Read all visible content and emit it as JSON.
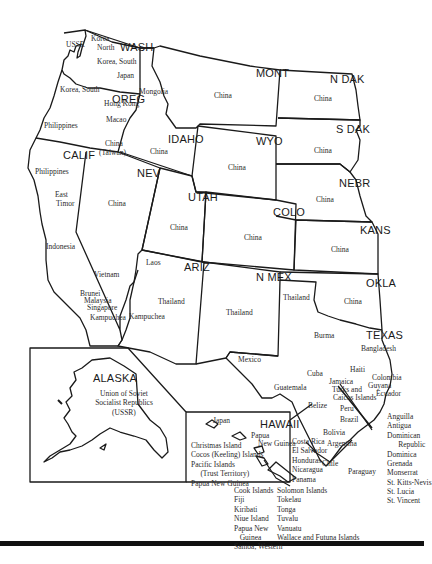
{
  "map": {
    "title": "Western United States with overlaid comparison countries",
    "states": [
      {
        "id": "wash",
        "label": "WASH",
        "countries": [
          "Korea, North",
          "Korea, South",
          "Japan"
        ]
      },
      {
        "id": "oreg",
        "label": "OREG",
        "countries": [
          "Korea, South",
          "Hong Kong",
          "Macao",
          "China (Taiwan)",
          "Philippines"
        ]
      },
      {
        "id": "calif",
        "label": "CALIF",
        "countries": [
          "Philippines",
          "East Timor",
          "Indonesia",
          "Vietnam",
          "Brunei",
          "Malaysia",
          "Singapore",
          "Kampuchea"
        ]
      },
      {
        "id": "idaho",
        "label": "IDAHO",
        "countries": [
          "Mongolia",
          "China"
        ]
      },
      {
        "id": "nev",
        "label": "NEV",
        "countries": [
          "China"
        ]
      },
      {
        "id": "mont",
        "label": "MONT",
        "countries": [
          "China"
        ]
      },
      {
        "id": "wyo",
        "label": "WYO",
        "countries": [
          "China"
        ]
      },
      {
        "id": "utah",
        "label": "UTAH",
        "countries": [
          "China"
        ]
      },
      {
        "id": "colo",
        "label": "COLO",
        "countries": [
          "China"
        ]
      },
      {
        "id": "ariz",
        "label": "ARIZ",
        "countries": [
          "Laos",
          "Thailand",
          "Kampuchea"
        ]
      },
      {
        "id": "nmex",
        "label": "N MEX",
        "countries": [
          "Thailand"
        ]
      },
      {
        "id": "ndak",
        "label": "N DAK",
        "countries": [
          "China"
        ]
      },
      {
        "id": "sdak",
        "label": "S DAK",
        "countries": [
          "China"
        ]
      },
      {
        "id": "nebr",
        "label": "NEBR",
        "countries": [
          "China"
        ]
      },
      {
        "id": "kans",
        "label": "KANS",
        "countries": [
          "China"
        ]
      },
      {
        "id": "okla",
        "label": "OKLA",
        "countries": [
          "China"
        ]
      },
      {
        "id": "texas",
        "label": "TEXAS",
        "countries": [
          "Thailand",
          "Burma",
          "Bangladesh",
          "Mexico",
          "Cuba",
          "Guatemala",
          "Belize",
          "Haiti",
          "Jamaica",
          "Turks and Caicos Islands",
          "Colombia",
          "Guyana",
          "Ecuador",
          "Peru",
          "Brazil",
          "Bolivia",
          "Argentina",
          "Costa Rica",
          "El Salvador",
          "Honduras",
          "Nicaragua",
          "Panama",
          "Chile",
          "Paraguay"
        ]
      },
      {
        "id": "alaska",
        "label": "ALASKA",
        "countries": [
          "Union of Soviet Socialist Republics (USSR)"
        ]
      },
      {
        "id": "hawaii",
        "label": "HAWAII",
        "countries": [
          "Japan",
          "Papua New Guinea",
          "Christmas Island",
          "Cocos (Keeling) Islands",
          "Pacific Islands (Trust Territory)",
          "Papua New Guinea"
        ]
      }
    ],
    "labels": {
      "wash": "WASH",
      "oreg": "OREG",
      "calif": "CALIF",
      "idaho": "IDAHO",
      "nev": "NEV",
      "mont": "MONT",
      "wyo": "WYO",
      "utah": "UTAH",
      "colo": "COLO",
      "ariz": "ARIZ",
      "nmex": "N MEX",
      "ndak": "N DAK",
      "sdak": "S DAK",
      "nebr": "NEBR",
      "kans": "KANS",
      "okla": "OKLA",
      "texas": "TEXAS",
      "alaska": "ALASKA",
      "hawaii": "HAWAII"
    },
    "countries": {
      "ussr_nw": "USSR",
      "korea_north_1": "Korea",
      "korea_north_2": "North",
      "korea_south_wa": "Korea, South",
      "japan_wa": "Japan",
      "korea_south_or": "Korea, South",
      "hong_kong": "Hong Kong",
      "macao": "Macao",
      "philippines_or": "Philippines",
      "china_taiwan_1": "China",
      "china_taiwan_2": "(Taiwan)",
      "mongolia": "Mongolia",
      "china_idaho": "China",
      "china_mont": "China",
      "china_ndak": "China",
      "china_sdak": "China",
      "china_wyo": "China",
      "china_nebr": "China",
      "china_nev": "China",
      "china_utah": "China",
      "china_colo": "China",
      "china_kans": "China",
      "china_okla": "China",
      "philippines_ca": "Philippines",
      "east_timor_1": "East",
      "east_timor_2": "Timor",
      "indonesia": "Indonesia",
      "vietnam": "Vietnam",
      "laos": "Laos",
      "brunei": "Brunei",
      "malaysia": "Malaysia",
      "singapore": "Singapore",
      "kampuchea_ca": "Kampuchea",
      "kampuchea_az": "Kampuchea",
      "thailand_az": "Thailand",
      "thailand_nm": "Thailand",
      "thailand_tx": "Thailand",
      "burma": "Burma",
      "bangladesh": "Bangladesh",
      "mexico": "Mexico",
      "cuba": "Cuba",
      "guatemala": "Guatemala",
      "belize": "Belize",
      "haiti": "Haiti",
      "jamaica": "Jamaica",
      "turks_1": "Turks and",
      "turks_2": "Caicos Islands",
      "colombia": "Colombia",
      "guyana": "Guyana",
      "ecuador": "Ecuador",
      "peru": "Peru",
      "brazil": "Brazil",
      "bolivia": "Bolivia",
      "argentina": "Argentina",
      "chile": "Chile",
      "paraguay": "Paraguay",
      "central_america": "Costa Rica\nEl Salvador\nHonduras\nNicaragua\nPanama",
      "caribbean_list": "Anguilla\nAntigua\nDominican\n      Republic\nDominica\nGrenada\nMonserrat\nSt. Kitts-Nevis\nSt. Lucia\nSt. Vincent",
      "ussr_alaska_1": "Union of Soviet",
      "ussr_alaska_2": "Socialist Republics",
      "ussr_alaska_3": "(USSR)",
      "japan_hi": "Japan",
      "png_hi_1": "Papua",
      "png_hi_2": "New Guinea",
      "hawaii_list": "Christmas Island\nCocos (Keeling) Islands\nPacific Islands\n     (Trust Territory)\nPapua New Guinea",
      "pacific_list_1": "Cook Islands\nFiji\nKiribati\nNiue Island\nPapua New\n   Guinea\nSamoa, Western",
      "pacific_list_2": "Solomon Islands\nTokelau\nTonga\nTuvalu\nVanuatu\nWallace and Futuna Islands"
    },
    "colors": {
      "ink": "#1a1a1a",
      "paper": "#ffffff",
      "rule": "#111111"
    }
  }
}
